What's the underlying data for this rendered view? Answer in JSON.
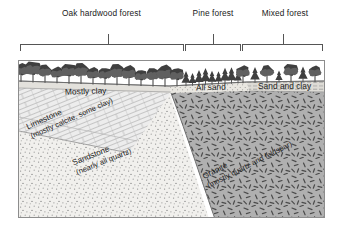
{
  "figure": {
    "zones": [
      {
        "id": "oak",
        "label": "Oak hardwood forest",
        "tree_type": "deciduous",
        "start_x": 20,
        "end_x": 183,
        "tick_x": 108,
        "label_x": 108,
        "label_y": 14
      },
      {
        "id": "pine",
        "label": "Pine forest",
        "tree_type": "conifer",
        "start_x": 185,
        "end_x": 240,
        "tick_x": 213,
        "label_x": 213,
        "label_y": 14
      },
      {
        "id": "mixed",
        "label": "Mixed forest",
        "tree_type": "mixed",
        "start_x": 242,
        "end_x": 322,
        "tick_x": 283,
        "label_x": 283,
        "label_y": 14
      }
    ],
    "surface_layers": [
      {
        "id": "mostly-clay",
        "label": "Mostly clay",
        "x": 62,
        "y": 88,
        "rotate": -5
      },
      {
        "id": "all-sand",
        "label": "All sand",
        "x": 196,
        "y": 85,
        "rotate": -4
      },
      {
        "id": "sand-and-clay",
        "label": "Sand and clay",
        "x": 259,
        "y": 83,
        "rotate": 0
      }
    ],
    "rock_units": [
      {
        "id": "limestone",
        "name": "Limestone",
        "composition": "(mostly calcite, some clay)",
        "pattern": "brick",
        "x": 22,
        "y": 124,
        "rotate": -24
      },
      {
        "id": "sandstone",
        "name": "Sandstone",
        "composition": "(nearly all quartz)",
        "pattern": "stipple",
        "x": 70,
        "y": 160,
        "rotate": -22
      },
      {
        "id": "granite",
        "name": "Granite",
        "composition": "(mostly quartz and feldspar)",
        "pattern": "dashes",
        "x": 202,
        "y": 178,
        "rotate": -27
      }
    ],
    "colors": {
      "ink": "#1d1d1d",
      "frame": "#8d8d8d",
      "soil_band": "#e3e1dc",
      "limestone_fill": "#ececec",
      "sandstone_fill": "#efefec",
      "granite_fill": "#aeaeae",
      "tree_dark": "#3f3f3f",
      "tree_mid": "#606060"
    }
  }
}
